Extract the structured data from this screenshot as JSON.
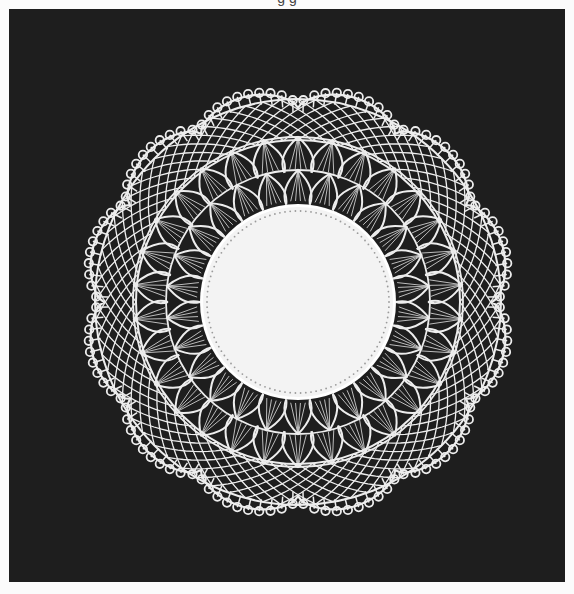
{
  "page": {
    "top_cropped_text": "g g",
    "background_page": "#fbfbfb",
    "panel_color": "#1e1e1e"
  },
  "photo": {
    "subject": "round lace doily with linen center",
    "center": [
      289,
      293
    ],
    "linen": {
      "radius": 95,
      "color": "#f3f3f3",
      "hemstitch_radius": 91,
      "hemstitch_dots": 110
    },
    "thread_color": "#ededed",
    "rings": {
      "fan_inner": {
        "r0": 98,
        "r1": 132,
        "count": 26
      },
      "fan_outer": {
        "r0": 130,
        "r1": 165,
        "count": 30
      },
      "mesh": {
        "r0": 162,
        "r1": 203,
        "count": 72
      },
      "scallops": {
        "count": 12,
        "r_base": 200,
        "r_peak": 218,
        "picots_per_scallop": 5
      }
    }
  }
}
